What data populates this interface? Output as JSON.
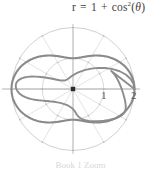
{
  "figure": {
    "equation": {
      "lhs": "r",
      "equals": "=",
      "term_one": "1",
      "plus": "+",
      "function": "cos",
      "exponent": "2",
      "open_paren": "(",
      "variable": "θ",
      "close_paren": ")",
      "full_text": "r = 1 + cos²(θ)"
    },
    "axis_tick_labels": {
      "inner": "1",
      "outer": "2"
    },
    "caption_partial": "Book 1 Zoom",
    "colors": {
      "background": "#ffffff",
      "curve": "#8a8a8a",
      "grid": "#c9c9c9",
      "axis": "#9a9a9a",
      "origin_marker": "#2b2b2b",
      "text": "#4a4a4a"
    }
  },
  "chart_data": {
    "type": "line",
    "coordinate_system": "polar",
    "equation": "r = 1 + cos^2(theta)",
    "xlabel": "",
    "ylabel": "",
    "rlim": [
      0,
      2
    ],
    "r_ticks": [
      1,
      2
    ],
    "r_tick_labels": [
      "1",
      "2"
    ],
    "theta_gridlines_deg": [
      0,
      30,
      60,
      90,
      120,
      150,
      180,
      210,
      240,
      270,
      300,
      330
    ],
    "grid": true,
    "legend": false,
    "origin_marker": true,
    "series": [
      {
        "name": "r = 1 + cos^2(theta)",
        "color": "#8a8a8a",
        "theta_deg": [
          0,
          15,
          30,
          45,
          60,
          75,
          90,
          105,
          120,
          135,
          150,
          165,
          180,
          195,
          210,
          225,
          240,
          255,
          270,
          285,
          300,
          315,
          330,
          345,
          360
        ],
        "r": [
          2.0,
          1.933,
          1.75,
          1.5,
          1.25,
          1.067,
          1.0,
          1.067,
          1.25,
          1.5,
          1.75,
          1.933,
          2.0,
          1.933,
          1.75,
          1.5,
          1.25,
          1.067,
          1.0,
          1.067,
          1.25,
          1.5,
          1.75,
          1.933,
          2.0
        ]
      },
      {
        "name": "reference circle r = 2",
        "color": "#c9c9c9",
        "constant_r": 2
      },
      {
        "name": "reference circle r = 1",
        "color": "#c9c9c9",
        "constant_r": 1
      }
    ],
    "r_max": 2,
    "r_min": 1,
    "r_max_at_theta_deg": [
      0,
      180
    ],
    "r_min_at_theta_deg": [
      90,
      270
    ]
  }
}
